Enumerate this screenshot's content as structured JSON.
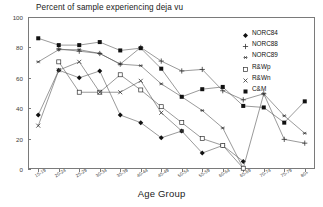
{
  "chart_data": {
    "type": "line",
    "title": "Percent of sample experiencing deja vu",
    "xlabel": "Age Group",
    "ylabel": "",
    "ylim": [
      0,
      100
    ],
    "yticks": [
      0,
      20,
      40,
      60,
      80,
      100
    ],
    "grid": false,
    "legend_position": "top-right",
    "categories": [
      "15-19",
      "20-24",
      "25-29",
      "30-34",
      "35-39",
      "40-44",
      "45-49",
      "50-54",
      "55-59",
      "60-64",
      "65-69",
      "70-74",
      "75-79",
      "80+"
    ],
    "series": [
      {
        "name": "NORC84",
        "marker": "filled-diamond",
        "values": [
          35.5,
          65.0,
          60.0,
          64.5,
          35.5,
          30.5,
          20.5,
          25.0,
          10.5,
          15.5,
          5.0,
          null,
          null,
          null
        ]
      },
      {
        "name": "NORC88",
        "marker": "plus",
        "values": [
          null,
          79.0,
          77.5,
          76.0,
          69.0,
          80.0,
          71.0,
          64.5,
          65.5,
          51.5,
          35.0,
          null,
          null,
          null
        ]
      },
      {
        "name": "NORC89",
        "marker": "asterisk",
        "values": [
          70.5,
          78.5,
          78.5,
          76.0,
          69.0,
          68.0,
          56.0,
          47.5,
          38.5,
          27.0,
          0.5,
          null,
          null,
          null
        ]
      },
      {
        "name": "R&Wp",
        "marker": "open-square",
        "values": [
          null,
          70.5,
          50.5,
          50.5,
          62.0,
          52.0,
          41.0,
          30.5,
          20.0,
          15.5,
          0.5,
          null,
          null,
          null
        ]
      },
      {
        "name": "R&Wn",
        "marker": "x-cross",
        "values": [
          28.5,
          65.0,
          70.5,
          50.5,
          50.5,
          58.0,
          37.0,
          25.0,
          null,
          null,
          null,
          null,
          null,
          null
        ]
      },
      {
        "name": "C&M",
        "marker": "filled-square",
        "values": [
          86.0,
          81.5,
          81.5,
          83.5,
          78.0,
          79.5,
          66.0,
          47.5,
          52.5,
          54.0,
          41.5,
          40.5,
          30.5,
          44.5
        ]
      }
    ],
    "extra_series_points": {
      "NORC88_tail": [
        null,
        null,
        null,
        null,
        null,
        null,
        null,
        null,
        null,
        null,
        45.5,
        49.5,
        19.5,
        17.0
      ],
      "NORC89_tail": [
        null,
        null,
        null,
        null,
        null,
        null,
        null,
        null,
        null,
        null,
        null,
        49.5,
        35.0,
        23.5
      ]
    }
  },
  "legend": {
    "items": [
      {
        "label": "NORC84"
      },
      {
        "label": "NORC88"
      },
      {
        "label": "NORC89"
      },
      {
        "label": "R&Wp"
      },
      {
        "label": "R&Wn"
      },
      {
        "label": "C&M"
      }
    ]
  }
}
